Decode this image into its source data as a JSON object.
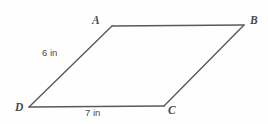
{
  "figure": {
    "type": "parallelogram-diagram",
    "background_color": "#fefefe",
    "stroke_color": "#5a5a5a",
    "text_color": "#4a4a4a",
    "vertices": [
      {
        "name": "A",
        "label": "A",
        "x": 112,
        "y": 26
      },
      {
        "name": "B",
        "label": "B",
        "x": 244,
        "y": 25
      },
      {
        "name": "C",
        "label": "C",
        "x": 164,
        "y": 106
      },
      {
        "name": "D",
        "label": "D",
        "x": 29,
        "y": 107
      }
    ],
    "side_labels": [
      {
        "name": "side-ad",
        "label": "6 in",
        "side": "DA",
        "value": 6,
        "unit": "in"
      },
      {
        "name": "side-dc",
        "label": "7 in",
        "side": "DC",
        "value": 7,
        "unit": "in"
      }
    ]
  }
}
